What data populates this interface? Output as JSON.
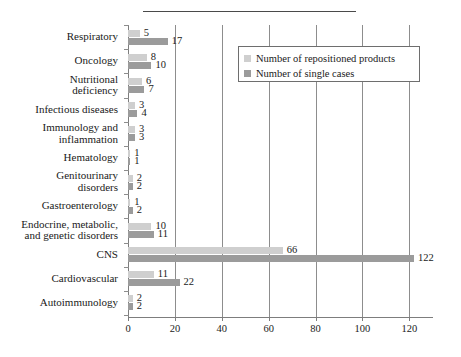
{
  "chart_data": {
    "type": "bar",
    "orientation": "horizontal",
    "title": "",
    "xlabel": "",
    "ylabel": "",
    "xlim": [
      0,
      125
    ],
    "xticks": [
      0,
      20,
      40,
      60,
      80,
      100,
      120
    ],
    "xticklabels": [
      "0",
      "20",
      "40",
      "60",
      "80",
      "100",
      "120"
    ],
    "grid": "vertical",
    "legend_position": "top-right",
    "categories": [
      "Respiratory",
      "Oncology",
      "Nutritional\ndeficiency",
      "Infectious diseases",
      "Immunology and\ninflammation",
      "Hematology",
      "Genitourinary\ndisorders",
      "Gastroenterology",
      "Endocrine, metabolic,\nand genetic disorders",
      "CNS",
      "Cardiovascular",
      "Autoimmunology"
    ],
    "series": [
      {
        "name": "Number of repositioned products",
        "color": "#cfcfcf",
        "values": [
          5,
          8,
          6,
          3,
          3,
          1,
          2,
          1,
          10,
          66,
          11,
          2
        ]
      },
      {
        "name": "Number of single cases",
        "color": "#9b9b9b",
        "values": [
          17,
          10,
          7,
          4,
          3,
          1,
          2,
          2,
          11,
          122,
          22,
          2
        ]
      }
    ]
  },
  "legend": {
    "items": [
      {
        "label": "Number of repositioned products",
        "swatch": "light"
      },
      {
        "label": "Number of single cases",
        "swatch": "dark"
      }
    ]
  }
}
